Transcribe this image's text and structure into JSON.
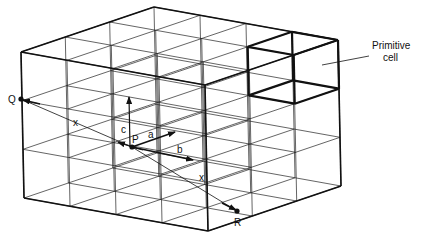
{
  "figure": {
    "colors": {
      "ink": "#111111",
      "background": "#ffffff"
    }
  },
  "lattice": {
    "origin": [
      21,
      52
    ],
    "u_vector": [
      184,
      33
    ],
    "v_vector": [
      133,
      -45
    ],
    "w_vector": [
      3,
      146
    ],
    "cells_u": 4,
    "cells_v": 3,
    "cells_w": 3
  },
  "primitive_cell": {
    "label_line1": "Primitive",
    "label_line2": "cell",
    "u_range": [
      3,
      4
    ],
    "v_range": [
      2,
      3
    ],
    "w_range": [
      0,
      1
    ]
  },
  "points": {
    "Q": {
      "label": "Q",
      "xy": [
        21,
        99
      ]
    },
    "P": {
      "label": "P",
      "xy": [
        132,
        147
      ]
    },
    "R": {
      "label": "R",
      "xy": [
        237,
        211
      ]
    }
  },
  "vectors": {
    "a": {
      "label": "a"
    },
    "b": {
      "label": "b"
    },
    "c": {
      "label": "c"
    }
  },
  "translation_labels": {
    "x_left": "x",
    "x_right": "x"
  }
}
